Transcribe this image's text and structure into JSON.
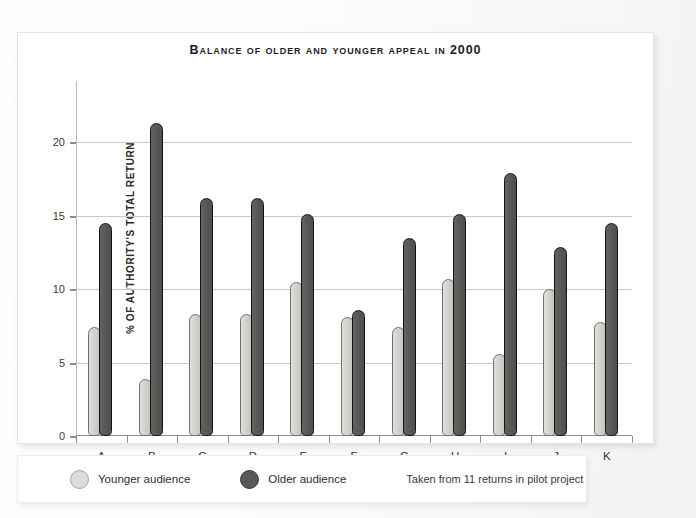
{
  "chart_data": {
    "type": "bar",
    "title": "Balance of older and younger appeal in 2000",
    "xlabel": "",
    "ylabel": "% of authority's total return",
    "categories": [
      "A",
      "B",
      "C",
      "D",
      "E",
      "F",
      "G",
      "H",
      "I",
      "J",
      "K"
    ],
    "series": [
      {
        "name": "Younger audience",
        "color": "#d2d2cf",
        "values": [
          7.4,
          3.9,
          8.3,
          8.3,
          10.5,
          8.1,
          7.4,
          10.7,
          5.6,
          10.0,
          7.8
        ]
      },
      {
        "name": "Older audience",
        "color": "#585856",
        "values": [
          14.5,
          21.3,
          16.2,
          16.2,
          15.1,
          8.6,
          13.5,
          15.1,
          17.9,
          12.9,
          14.5
        ]
      }
    ],
    "ylim": [
      0,
      23.5
    ],
    "yticks": [
      0,
      5,
      10,
      15,
      20
    ],
    "ytick_labels": [
      "0",
      "5",
      "10",
      "15",
      "20"
    ],
    "grid": true,
    "legend_position": "bottom",
    "annotations": [
      "Taken from 11 returns in pilot project"
    ]
  },
  "legend": {
    "younger_label": "Younger audience",
    "older_label": "Older audience",
    "note": "Taken from 11 returns in pilot project"
  }
}
